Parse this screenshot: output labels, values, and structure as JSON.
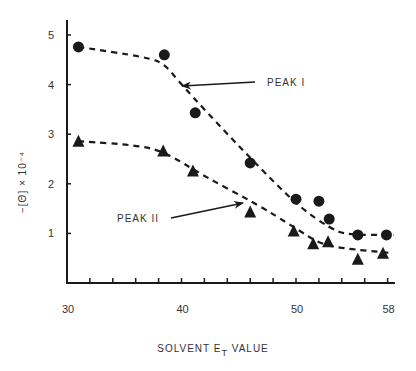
{
  "chart_data": {
    "type": "scatter",
    "title": "",
    "xlabel": "SOLVENT E_T VALUE",
    "xlabel_main": "SOLVENT E",
    "xlabel_sub": "T",
    "xlabel_tail": " VALUE",
    "ylabel": "−[Θ] × 10⁻⁴",
    "xlim": [
      30,
      58
    ],
    "ylim": [
      0,
      5.2
    ],
    "x_tick_labels": [
      "30",
      "40",
      "50",
      "58"
    ],
    "x_tick_values": [
      30,
      40,
      50,
      58
    ],
    "x_minor_ticks": [
      32,
      34,
      36,
      38,
      40,
      42,
      44,
      46,
      48,
      50,
      52,
      54,
      56,
      58
    ],
    "y_tick_labels": [
      "1",
      "2",
      "3",
      "4",
      "5"
    ],
    "y_tick_values": [
      1,
      2,
      3,
      4,
      5
    ],
    "grid": false,
    "legend": "none (series labeled by arrow annotations)",
    "series": [
      {
        "name": "PEAK I",
        "marker": "circle",
        "points": [
          {
            "x": 31.0,
            "y": 4.76
          },
          {
            "x": 38.5,
            "y": 4.6
          },
          {
            "x": 41.2,
            "y": 3.43
          },
          {
            "x": 46.0,
            "y": 2.42
          },
          {
            "x": 50.0,
            "y": 1.69
          },
          {
            "x": 52.0,
            "y": 1.65
          },
          {
            "x": 52.9,
            "y": 1.29
          },
          {
            "x": 55.4,
            "y": 0.97
          },
          {
            "x": 57.9,
            "y": 0.97
          }
        ],
        "fit_curve": [
          {
            "x": 31.0,
            "y": 4.76
          },
          {
            "x": 37.0,
            "y": 4.55
          },
          {
            "x": 38.5,
            "y": 4.42
          },
          {
            "x": 40.0,
            "y": 4.0
          },
          {
            "x": 44.0,
            "y": 3.0
          },
          {
            "x": 48.0,
            "y": 2.05
          },
          {
            "x": 50.5,
            "y": 1.5
          },
          {
            "x": 53.0,
            "y": 1.1
          },
          {
            "x": 54.5,
            "y": 0.97
          },
          {
            "x": 58.5,
            "y": 0.97
          }
        ]
      },
      {
        "name": "PEAK II",
        "marker": "triangle",
        "points": [
          {
            "x": 31.0,
            "y": 2.86
          },
          {
            "x": 38.4,
            "y": 2.66
          },
          {
            "x": 41.0,
            "y": 2.26
          },
          {
            "x": 46.0,
            "y": 1.43
          },
          {
            "x": 49.8,
            "y": 1.05
          },
          {
            "x": 51.5,
            "y": 0.79
          },
          {
            "x": 52.8,
            "y": 0.83
          },
          {
            "x": 55.4,
            "y": 0.48
          },
          {
            "x": 57.6,
            "y": 0.6
          }
        ],
        "fit_curve": [
          {
            "x": 31.0,
            "y": 2.86
          },
          {
            "x": 36.0,
            "y": 2.78
          },
          {
            "x": 38.5,
            "y": 2.65
          },
          {
            "x": 42.0,
            "y": 2.15
          },
          {
            "x": 46.5,
            "y": 1.6
          },
          {
            "x": 50.0,
            "y": 1.1
          },
          {
            "x": 52.0,
            "y": 0.8
          },
          {
            "x": 54.0,
            "y": 0.7
          },
          {
            "x": 58.5,
            "y": 0.6
          }
        ]
      }
    ],
    "annotations": [
      {
        "text": "PEAK I",
        "text_x": 267,
        "text_y": 86,
        "arrow_from": [
          255,
          82
        ],
        "arrow_to": [
          182,
          86
        ]
      },
      {
        "text": "PEAK II",
        "text_x": 117,
        "text_y": 222,
        "arrow_from": [
          171,
          218
        ],
        "arrow_to": [
          243,
          203
        ]
      }
    ]
  },
  "colors": {
    "ink": "#1a1a1a",
    "text": "#333333",
    "background": "#ffffff"
  },
  "layout": {
    "x_axis_px": 67,
    "y_axis_base_px": 283,
    "px_per_x_unit": 11.45,
    "px_per_y_unit": 49.6,
    "y_axis_top_px": 20,
    "x_axis_right_px": 395
  }
}
